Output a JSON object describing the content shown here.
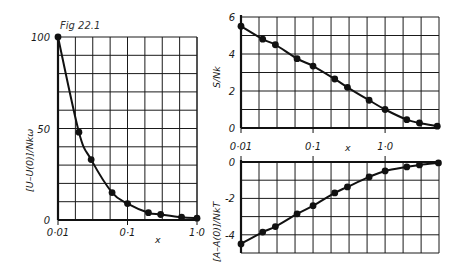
{
  "caption": "Fig 22.1",
  "chart_data": [
    {
      "type": "line",
      "id": "energy",
      "title": "",
      "xlabel": "x",
      "ylabel": "[U–U(0)]/Nkω",
      "xscale": "log",
      "xlim": [
        0.01,
        1.0
      ],
      "ylim": [
        0,
        100
      ],
      "xticks": [
        {
          "value": 0.01,
          "label": "0·01"
        },
        {
          "value": 0.1,
          "label": "0·1"
        },
        {
          "value": 1.0,
          "label": "1·0"
        }
      ],
      "yticks": [
        {
          "value": 0,
          "label": "0"
        },
        {
          "value": 50,
          "label": "50"
        },
        {
          "value": 100,
          "label": "100"
        }
      ],
      "grid": true,
      "grid_x_divisions_per_decade": 4,
      "grid_y_step": 10,
      "series": [
        {
          "name": "U",
          "x": [
            0.01,
            0.02,
            0.03,
            0.06,
            0.1,
            0.2,
            0.3,
            0.6,
            1.0
          ],
          "values": [
            100,
            48,
            33,
            15,
            9,
            4,
            3,
            1.5,
            1
          ]
        }
      ]
    },
    {
      "type": "line",
      "id": "entropy",
      "title": "",
      "xlabel": "x",
      "ylabel": "S/Nk",
      "xscale": "log",
      "xlim": [
        0.01,
        5.6
      ],
      "ylim": [
        0,
        6
      ],
      "xticks": [
        {
          "value": 0.01,
          "label": "0·01"
        },
        {
          "value": 0.1,
          "label": "0·1"
        },
        {
          "value": 1.0,
          "label": "1·0"
        }
      ],
      "yticks": [
        {
          "value": 0,
          "label": "0"
        },
        {
          "value": 2,
          "label": "2"
        },
        {
          "value": 4,
          "label": "4"
        },
        {
          "value": 6,
          "label": "6"
        }
      ],
      "grid": true,
      "grid_x_divisions_per_decade": 4,
      "grid_y_step": 1,
      "series": [
        {
          "name": "S",
          "x": [
            0.01,
            0.02,
            0.03,
            0.06,
            0.1,
            0.2,
            0.3,
            0.6,
            1.0,
            2.0,
            3.0,
            5.3
          ],
          "values": [
            5.5,
            4.8,
            4.5,
            3.75,
            3.35,
            2.65,
            2.2,
            1.5,
            1.0,
            0.45,
            0.27,
            0.1
          ]
        }
      ]
    },
    {
      "type": "line",
      "id": "free-energy",
      "title": "",
      "xlabel": "",
      "ylabel": "[A–A(0)]/NkT",
      "xscale": "log",
      "xlim": [
        0.01,
        5.6
      ],
      "ylim": [
        -5,
        0
      ],
      "xticks": [
        {
          "value": 0.01,
          "label": ""
        },
        {
          "value": 0.1,
          "label": ""
        },
        {
          "value": 1.0,
          "label": ""
        }
      ],
      "yticks": [
        {
          "value": 0,
          "label": "0"
        },
        {
          "value": -2,
          "label": "-2"
        },
        {
          "value": -4,
          "label": "-4"
        }
      ],
      "grid": true,
      "grid_x_divisions_per_decade": 4,
      "grid_y_step": 1,
      "series": [
        {
          "name": "A",
          "x": [
            0.01,
            0.02,
            0.03,
            0.06,
            0.1,
            0.2,
            0.3,
            0.6,
            1.0,
            2.0,
            3.0,
            5.5
          ],
          "values": [
            -4.5,
            -3.85,
            -3.55,
            -2.85,
            -2.4,
            -1.7,
            -1.37,
            -0.82,
            -0.49,
            -0.27,
            -0.16,
            -0.05
          ]
        }
      ]
    }
  ]
}
